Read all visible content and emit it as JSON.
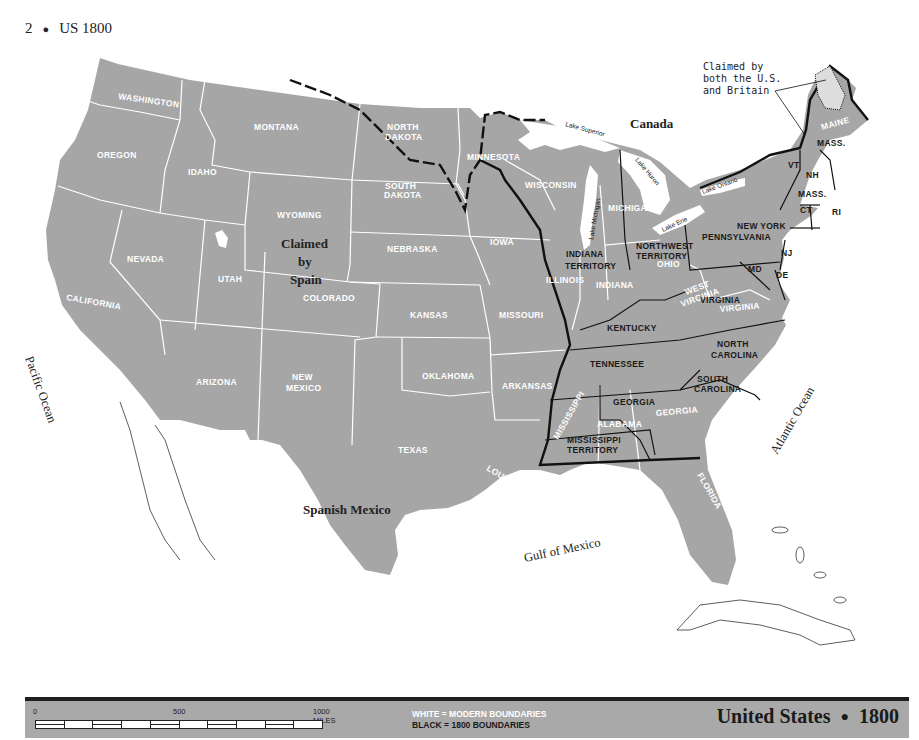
{
  "header": {
    "page_number": "2",
    "separator": "●",
    "title": "US 1800"
  },
  "map": {
    "regions": {
      "canada": "Canada",
      "claimed_by_spain": [
        "Claimed",
        "by",
        "Spain"
      ],
      "spanish_mexico": "Spanish Mexico"
    },
    "water": {
      "pacific": "Pacific Ocean",
      "atlantic": "Atlantic Ocean",
      "gulf": "Gulf of Mexico",
      "lake_superior": "Lake Superior",
      "lake_michigan": "Lake Michigan",
      "lake_huron": "Lake Huron",
      "lake_erie": "Lake Erie",
      "lake_ontario": "Lake Ontario"
    },
    "annotation": [
      "Claimed by",
      "both the U.S.",
      "and Britain"
    ],
    "modern_states": {
      "washington": "WASHINGTON",
      "oregon": "OREGON",
      "california": "CALIFORNIA",
      "idaho": "IDAHO",
      "nevada": "NEVADA",
      "montana": "MONTANA",
      "wyoming": "WYOMING",
      "utah": "UTAH",
      "colorado": "COLORADO",
      "arizona": "ARIZONA",
      "new_mexico": [
        "NEW",
        "MEXICO"
      ],
      "north_dakota": [
        "NORTH",
        "DAKOTA"
      ],
      "south_dakota": [
        "SOUTH",
        "DAKOTA"
      ],
      "nebraska": "NEBRASKA",
      "kansas": "KANSAS",
      "oklahoma": "OKLAHOMA",
      "texas": "TEXAS",
      "minnesota": "MINNESOTA",
      "iowa": "IOWA",
      "missouri": "MISSOURI",
      "arkansas": "ARKANSAS",
      "louisiana": "LOUISIANA",
      "wisconsin": "WISCONSIN",
      "illinois": "ILLINOIS",
      "michigan": "MICHIGAN",
      "indiana": "INDIANA",
      "ohio": "OHIO",
      "west_virginia": [
        "WEST",
        "VIRGINIA"
      ],
      "virginia": "VIRGINIA",
      "mississippi": "MISSISSIPPI",
      "alabama": "ALABAMA",
      "georgia": "GEORGIA",
      "florida": "FLORIDA",
      "maine": "MAINE"
    },
    "historic_states": {
      "indiana_territory": [
        "INDIANA",
        "TERRITORY"
      ],
      "northwest_territory": [
        "NORTHWEST",
        "TERRITORY"
      ],
      "new_york": "NEW YORK",
      "pennsylvania": "PENNSYLVANIA",
      "vermont": "VT",
      "new_hampshire": "NH",
      "mass_north": "MASS.",
      "mass_south": "MASS.",
      "connecticut": "CT",
      "rhode_island": "RI",
      "new_jersey": "NJ",
      "delaware": "DE",
      "maryland": "MD",
      "virginia": "VIRGINIA",
      "kentucky": "KENTUCKY",
      "tennessee": "TENNESSEE",
      "north_carolina": [
        "NORTH",
        "CAROLINA"
      ],
      "south_carolina": [
        "SOUTH",
        "CAROLINA"
      ],
      "georgia": "GEORGIA",
      "mississippi_territory": [
        "MISSISSIPPI",
        "TERRITORY"
      ]
    },
    "colors": {
      "land": "#a6a6a6",
      "water": "#ffffff",
      "modern_boundary": "#ffffff",
      "historic_boundary": "#111111"
    }
  },
  "legend": {
    "scale": {
      "ticks": [
        "0",
        "500",
        "1000 MILES"
      ]
    },
    "key": {
      "white": "WHITE = MODERN BOUNDARIES",
      "black": "BLACK = 1800 BOUNDARIES"
    },
    "title": {
      "text": "United States",
      "separator": "●",
      "year": "1800"
    }
  }
}
